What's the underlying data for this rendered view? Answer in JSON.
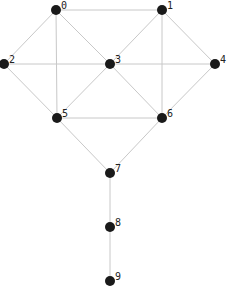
{
  "chart_data": {
    "type": "graph",
    "directed": false,
    "nodes": [
      {
        "id": "0",
        "label": "0",
        "x": 56,
        "y": 10
      },
      {
        "id": "1",
        "label": "1",
        "x": 162,
        "y": 10
      },
      {
        "id": "2",
        "label": "2",
        "x": 4,
        "y": 64
      },
      {
        "id": "3",
        "label": "3",
        "x": 110,
        "y": 64
      },
      {
        "id": "4",
        "label": "4",
        "x": 215,
        "y": 64
      },
      {
        "id": "5",
        "label": "5",
        "x": 57,
        "y": 118
      },
      {
        "id": "6",
        "label": "6",
        "x": 162,
        "y": 118
      },
      {
        "id": "7",
        "label": "7",
        "x": 110,
        "y": 173
      },
      {
        "id": "8",
        "label": "8",
        "x": 110,
        "y": 227
      },
      {
        "id": "9",
        "label": "9",
        "x": 110,
        "y": 281
      }
    ],
    "edges": [
      [
        "0",
        "1"
      ],
      [
        "0",
        "2"
      ],
      [
        "0",
        "3"
      ],
      [
        "0",
        "5"
      ],
      [
        "1",
        "3"
      ],
      [
        "1",
        "4"
      ],
      [
        "1",
        "6"
      ],
      [
        "2",
        "3"
      ],
      [
        "3",
        "4"
      ],
      [
        "2",
        "5"
      ],
      [
        "3",
        "5"
      ],
      [
        "3",
        "6"
      ],
      [
        "4",
        "6"
      ],
      [
        "5",
        "6"
      ],
      [
        "5",
        "7"
      ],
      [
        "6",
        "7"
      ],
      [
        "7",
        "8"
      ],
      [
        "8",
        "9"
      ]
    ]
  },
  "style": {
    "node_color": "#1a1a1a",
    "edge_color": "#c8c8c8",
    "label_color": "#222222",
    "node_radius": 5
  }
}
